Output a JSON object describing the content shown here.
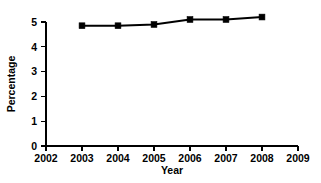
{
  "chart_data": {
    "type": "line",
    "title": "",
    "subtitle": "",
    "xlabel": "Year",
    "ylabel": "Percentage",
    "x": [
      2003,
      2004,
      2005,
      2006,
      2007,
      2008
    ],
    "values": [
      4.85,
      4.85,
      4.9,
      5.1,
      5.1,
      5.2
    ],
    "series": [
      {
        "name": "Percentage",
        "x": [
          2003,
          2004,
          2005,
          2006,
          2007,
          2008
        ],
        "values": [
          4.85,
          4.85,
          4.9,
          5.1,
          5.1,
          5.2
        ],
        "color": "#000000",
        "marker": "square",
        "line_style": "solid"
      }
    ],
    "xlim": [
      2002,
      2009
    ],
    "ylim": [
      0,
      5
    ],
    "xticks": [
      2002,
      2003,
      2004,
      2005,
      2006,
      2007,
      2008,
      2009
    ],
    "xtick_labels": [
      "2002",
      "2003",
      "2004",
      "2005",
      "2006",
      "2007",
      "2008",
      "2009"
    ],
    "yticks": [
      0,
      1,
      2,
      3,
      4,
      5
    ],
    "ytick_labels": [
      "0",
      "1",
      "2",
      "3",
      "4",
      "5"
    ],
    "grid": false,
    "legend": false,
    "legend_position": "none",
    "annotations": [],
    "background_color": "#ffffff",
    "axis_color": "#000000"
  }
}
